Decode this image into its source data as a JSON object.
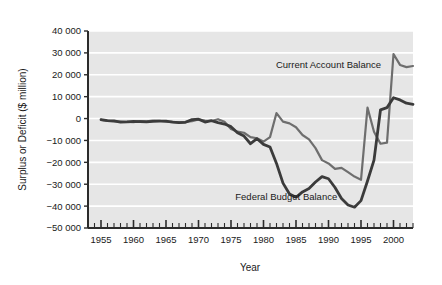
{
  "chart_data": {
    "type": "line",
    "title": "",
    "xlabel": "Year",
    "ylabel": "Surplus or Deficit ($ million)",
    "xlim": [
      1953,
      2003
    ],
    "ylim": [
      -50000,
      40000
    ],
    "grid": true,
    "grid_color": "#ffffff",
    "plot_background": "#e6e6e6",
    "legend": "inline-annotations",
    "xticks": [
      1955,
      1960,
      1965,
      1970,
      1975,
      1980,
      1985,
      1990,
      1995,
      2000
    ],
    "xtick_labels": [
      "1955",
      "1960",
      "1965",
      "1970",
      "1975",
      "1980",
      "1985",
      "1990",
      "1995",
      "2000"
    ],
    "xtick_minor_step": 1,
    "yticks": [
      40000,
      30000,
      20000,
      10000,
      0,
      -10000,
      -20000,
      -30000,
      -40000,
      -50000
    ],
    "ytick_labels": [
      "40 000",
      "30 000",
      "20 000",
      "10 000",
      "0",
      "−10 000",
      "−20 000",
      "−30 000",
      "−40 000",
      "−50 000"
    ],
    "annotations": [
      {
        "name": "current-account-balance-label",
        "text": "Current Account Balance",
        "x": 1990.0,
        "y": 24500
      },
      {
        "name": "federal-budget-balance-label",
        "text": "Federal Budget Balance",
        "x": 1983.5,
        "y": -35500
      }
    ],
    "series": [
      {
        "name": "Current Account Balance",
        "color": "#6e6e6e",
        "width": 2.2,
        "x": [
          1955,
          1956,
          1957,
          1958,
          1959,
          1960,
          1961,
          1962,
          1963,
          1964,
          1965,
          1966,
          1967,
          1968,
          1969,
          1970,
          1971,
          1972,
          1973,
          1974,
          1975,
          1976,
          1977,
          1978,
          1979,
          1980,
          1981,
          1982,
          1983,
          1984,
          1985,
          1986,
          1987,
          1988,
          1989,
          1990,
          1991,
          1992,
          1993,
          1994,
          1995,
          1996,
          1997,
          1998,
          1999,
          2000,
          2001,
          2002,
          2003
        ],
        "values": [
          -600,
          -1100,
          -1300,
          -1400,
          -1500,
          -1600,
          -1200,
          -1300,
          -900,
          -1000,
          -1400,
          -1500,
          -1700,
          -1500,
          -1200,
          -400,
          -900,
          -1100,
          -300,
          -1500,
          -4800,
          -6000,
          -6500,
          -8500,
          -9000,
          -10500,
          -8500,
          2500,
          -1400,
          -2200,
          -4000,
          -7500,
          -9500,
          -13500,
          -19000,
          -20500,
          -23000,
          -22500,
          -24500,
          -26500,
          -28000,
          5000,
          -6000,
          -11500,
          -11000,
          29500,
          24500,
          23500,
          24000
        ]
      },
      {
        "name": "Federal Budget Balance",
        "color": "#3b3b3b",
        "width": 2.8,
        "x": [
          1955,
          1956,
          1957,
          1958,
          1959,
          1960,
          1961,
          1962,
          1963,
          1964,
          1965,
          1966,
          1967,
          1968,
          1969,
          1970,
          1971,
          1972,
          1973,
          1974,
          1975,
          1976,
          1977,
          1978,
          1979,
          1980,
          1981,
          1982,
          1983,
          1984,
          1985,
          1986,
          1987,
          1988,
          1989,
          1990,
          1991,
          1992,
          1993,
          1994,
          1995,
          1996,
          1997,
          1998,
          1999,
          2000,
          2001,
          2002,
          2003
        ],
        "values": [
          -500,
          -900,
          -1100,
          -1600,
          -1500,
          -1300,
          -1400,
          -1500,
          -1300,
          -1200,
          -1200,
          -1600,
          -1900,
          -1700,
          -500,
          -300,
          -1600,
          -1000,
          -1900,
          -2500,
          -3700,
          -6500,
          -8000,
          -11500,
          -9200,
          -11800,
          -13000,
          -20500,
          -29500,
          -34500,
          -36000,
          -33500,
          -32000,
          -29000,
          -26500,
          -27500,
          -31500,
          -36500,
          -39500,
          -40500,
          -37500,
          -28500,
          -19000,
          4000,
          5000,
          9500,
          8500,
          7000,
          6500
        ]
      }
    ]
  },
  "axes": {
    "y_axis_label": "Surplus or Deficit ($ million)",
    "x_axis_label": "Year"
  }
}
